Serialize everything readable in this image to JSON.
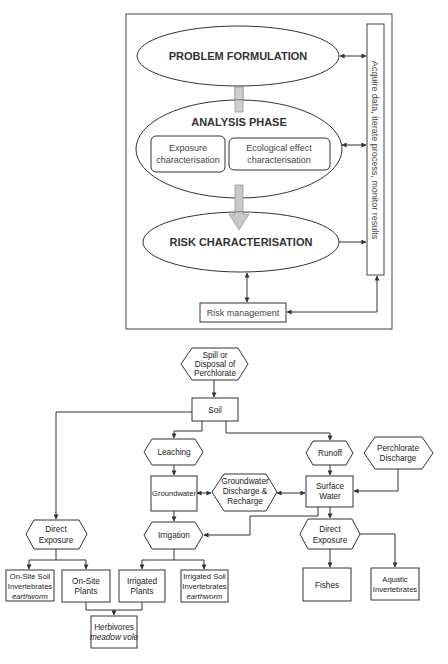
{
  "framework": {
    "problem_formulation": "PROBLEM FORMULATION",
    "analysis_phase": "ANALYSIS PHASE",
    "exposure_char_line1": "Exposure",
    "exposure_char_line2": "characterisation",
    "ecological_char_line1": "Ecological effect",
    "ecological_char_line2": "characterisation",
    "risk_characterisation": "RISK CHARACTERISATION",
    "risk_management": "Risk management",
    "side_bar": "Acquire data, iterate process, monitor results"
  },
  "flow": {
    "spill": [
      "Spill or",
      "Disposal of",
      "Perchlorate"
    ],
    "soil": "Soil",
    "leaching": "Leaching",
    "runoff": "Runoff",
    "perchlorate_discharge": [
      "Perchlorate",
      "Discharge"
    ],
    "groundwater": "Groundwater",
    "gw_discharge": [
      "Groundwater",
      "Discharge &",
      "Recharge"
    ],
    "surface_water": [
      "Surface",
      "Water"
    ],
    "irrigation": "Irrigation",
    "direct_exposure_left": [
      "Direct",
      "Exposure"
    ],
    "direct_exposure_right": [
      "Direct",
      "Exposure"
    ],
    "onsite_soil_inv": [
      "On-Site Soil",
      "Invertebrates",
      "earthworm"
    ],
    "onsite_plants": [
      "On-Site",
      "Plants"
    ],
    "irrigated_plants": [
      "Irrigated",
      "Plants"
    ],
    "irrigated_soil_inv": [
      "Irrigated Soil",
      "Invertebrates",
      "earthworm"
    ],
    "herbivores": [
      "Herbivores",
      "meadow vole"
    ],
    "fishes": "Fishes",
    "aquatic_inv": [
      "Aquatic",
      "Invertebrates"
    ]
  },
  "colors": {
    "line": "#333333",
    "connector_fill": "#cfcfcf",
    "arrow_fill": "#c8c8c8"
  }
}
